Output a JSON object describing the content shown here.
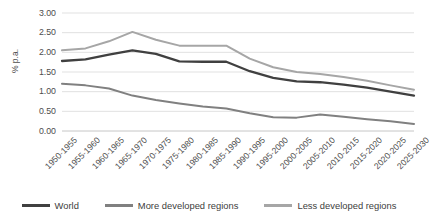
{
  "chart_data": {
    "type": "line",
    "title": "",
    "xlabel": "",
    "ylabel": "% p.a.",
    "ylim": [
      0,
      3.0
    ],
    "ytick_step": 0.5,
    "grid": true,
    "legend_position": "bottom",
    "categories": [
      "1950-1955",
      "1955-1960",
      "1960-1965",
      "1965-1970",
      "1970-1975",
      "1975-1980",
      "1980-1985",
      "1985-1990",
      "1990-1995",
      "1995-2000",
      "2000-2005",
      "2005-2010",
      "2010-2015",
      "2015-2020",
      "2020-2025",
      "2025-2030"
    ],
    "ytick_labels": [
      "0.00",
      "0.50",
      "1.00",
      "1.50",
      "2.00",
      "2.50",
      "3.00"
    ],
    "series": [
      {
        "name": "World",
        "color": "#404040",
        "values": [
          1.78,
          1.82,
          1.94,
          2.05,
          1.96,
          1.77,
          1.76,
          1.76,
          1.52,
          1.35,
          1.26,
          1.24,
          1.18,
          1.1,
          1.0,
          0.9
        ]
      },
      {
        "name": "More developed regions",
        "color": "#808080",
        "values": [
          1.2,
          1.16,
          1.08,
          0.9,
          0.79,
          0.7,
          0.62,
          0.57,
          0.45,
          0.35,
          0.34,
          0.42,
          0.36,
          0.3,
          0.25,
          0.18
        ]
      },
      {
        "name": "Less developed regions",
        "color": "#a6a6a6",
        "values": [
          2.05,
          2.1,
          2.28,
          2.52,
          2.32,
          2.17,
          2.17,
          2.17,
          1.84,
          1.62,
          1.5,
          1.45,
          1.37,
          1.28,
          1.16,
          1.05
        ]
      }
    ]
  },
  "legend": {
    "items": [
      {
        "label": "World",
        "color": "#404040"
      },
      {
        "label": "More developed regions",
        "color": "#808080"
      },
      {
        "label": "Less developed regions",
        "color": "#a6a6a6"
      }
    ]
  }
}
